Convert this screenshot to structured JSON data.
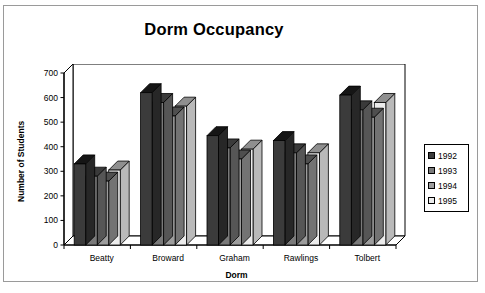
{
  "chart_data": {
    "type": "bar",
    "title": "Dorm Occupancy",
    "xlabel": "Dorm",
    "ylabel": "Number of Students",
    "categories": [
      "Beatty",
      "Broward",
      "Graham",
      "Rawlings",
      "Tolbert"
    ],
    "ylim": [
      0,
      700
    ],
    "yticks": [
      0,
      100,
      200,
      300,
      400,
      500,
      600,
      700
    ],
    "ytick_labels": [
      "0",
      "100",
      "200",
      "300",
      "400",
      "500",
      "600",
      "700"
    ],
    "grid": false,
    "legend_position": "right",
    "style": "3d-clustered-column",
    "series": [
      {
        "name": "1992",
        "color": "#3b3b3b",
        "side_color": "#272727",
        "top_color": "#151515",
        "values": [
          330,
          620,
          445,
          425,
          610
        ]
      },
      {
        "name": "1993",
        "color": "#7a7a7a",
        "side_color": "#565656",
        "top_color": "#3a3a3a",
        "values": [
          280,
          580,
          395,
          375,
          550
        ]
      },
      {
        "name": "1994",
        "color": "#9d9d9d",
        "side_color": "#737373",
        "top_color": "#4f4f4f",
        "values": [
          260,
          525,
          350,
          330,
          520
        ]
      },
      {
        "name": "1995",
        "color": "#ececec",
        "side_color": "#b9b9b9",
        "top_color": "#8f8f8f",
        "values": [
          305,
          565,
          390,
          375,
          580
        ]
      }
    ]
  },
  "legend": {
    "items": [
      {
        "label": "1992",
        "color": "#3b3b3b"
      },
      {
        "label": "1993",
        "color": "#7a7a7a"
      },
      {
        "label": "1994",
        "color": "#9d9d9d"
      },
      {
        "label": "1995",
        "color": "#ececec"
      }
    ]
  },
  "colors": {
    "page_background": "#ffffff",
    "frame_border": "#9a9a9a",
    "axis": "#000000",
    "text": "#000000"
  }
}
